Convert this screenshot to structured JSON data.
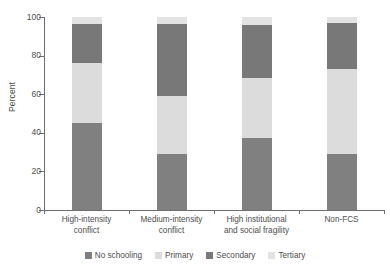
{
  "chart_data": {
    "type": "bar",
    "subtype": "stacked-bar-100",
    "title": "",
    "xlabel": "",
    "ylabel": "Percent",
    "ylim": [
      0,
      100
    ],
    "yticks": [
      0,
      20,
      40,
      60,
      80,
      100
    ],
    "grid": false,
    "legend_position": "bottom",
    "categories": [
      "High-intensity conflict",
      "Medium-intensity conflict",
      "High institutional and social fragility",
      "Non-FCS"
    ],
    "category_lines": [
      [
        "High-intensity",
        "conflict"
      ],
      [
        "Medium-intensity",
        "conflict"
      ],
      [
        "High institutional",
        "and social fragility"
      ],
      [
        "Non-FCS",
        ""
      ]
    ],
    "series": [
      {
        "name": "No schooling",
        "color": "#808080",
        "values": [
          45.0,
          29.0,
          37.5,
          29.0
        ]
      },
      {
        "name": "Primary",
        "color": "#dcdcdc",
        "values": [
          31.0,
          30.0,
          31.0,
          44.0
        ]
      },
      {
        "name": "Secondary",
        "color": "#787878",
        "values": [
          20.5,
          37.5,
          27.5,
          24.0
        ]
      },
      {
        "name": "Tertiary",
        "color": "#e3e3e3",
        "values": [
          3.5,
          3.5,
          4.0,
          3.0
        ]
      }
    ]
  },
  "axis": {
    "y_title": "Percent",
    "y_tick_labels": [
      "0",
      "20",
      "40",
      "60",
      "80",
      "100"
    ]
  },
  "legend": {
    "items": [
      {
        "label": "No schooling",
        "color": "#808080"
      },
      {
        "label": "Primary",
        "color": "#dcdcdc"
      },
      {
        "label": "Secondary",
        "color": "#787878"
      },
      {
        "label": "Tertiary",
        "color": "#e3e3e3"
      }
    ]
  }
}
